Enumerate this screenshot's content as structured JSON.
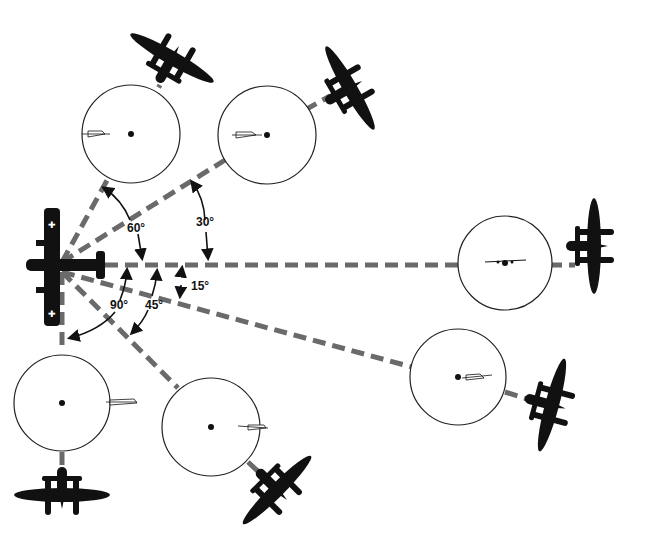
{
  "diagram": {
    "target_aircraft": "bomber",
    "attacker_aircraft": "P-38 twin-boom fighter",
    "angles": [
      {
        "label": "60°",
        "degrees": 60
      },
      {
        "label": "30°",
        "degrees": 30
      },
      {
        "label": "15°",
        "degrees": 15
      },
      {
        "label": "45°",
        "degrees": 45
      },
      {
        "label": "90°",
        "degrees": 90
      }
    ],
    "sights": [
      {
        "name": "sight-60",
        "angle": 60
      },
      {
        "name": "sight-30",
        "angle": 30
      },
      {
        "name": "sight-0",
        "angle": 0
      },
      {
        "name": "sight-15",
        "angle": 15
      },
      {
        "name": "sight-45",
        "angle": 45
      },
      {
        "name": "sight-90",
        "angle": 90
      }
    ]
  }
}
